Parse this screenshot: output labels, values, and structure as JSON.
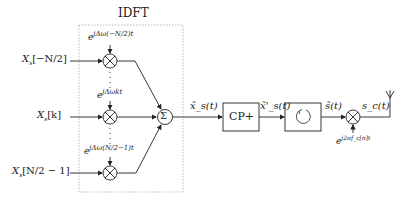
{
  "diagram": {
    "title": "IDFT",
    "inputs": [
      {
        "label": "X_s[−N/2]",
        "main": "X",
        "sub": "s",
        "index": "[−N/2]"
      },
      {
        "label": "X_s[k]",
        "main": "X",
        "sub": "s",
        "index": "[k]"
      },
      {
        "label": "X_s[N/2 − 1]",
        "main": "X",
        "sub": "s",
        "index": "[N/2 − 1]"
      }
    ],
    "exponentials": [
      {
        "label": "e^{jΔω(−N/2)t}",
        "base": "e",
        "exp": "jΔω(−N/2)t"
      },
      {
        "label": "e^{jΔωkt}",
        "base": "e",
        "exp": "jΔωkt"
      },
      {
        "label": "e^{jΔω(N/2−1)t}",
        "base": "e",
        "exp": "jΔω(N/2−1)t"
      }
    ],
    "sum_symbol": "Σ",
    "multiplier_symbol": "⊗",
    "signals": {
      "after_idft": "x̃_s(t)",
      "after_cp": "x̃'_s(t)",
      "after_rotate": "s̃(t)",
      "output": "s_c(t)"
    },
    "blocks": {
      "cp": "CP+",
      "rotate_icon": "circular-arrow"
    },
    "carrier": {
      "label": "e^{j2πf_c[n]t}",
      "base": "e",
      "exp": "j2πf_c[n]t"
    },
    "dots": "⋮",
    "colors": {
      "line": "#222222",
      "dashed_box": "#aaaaaa"
    }
  }
}
